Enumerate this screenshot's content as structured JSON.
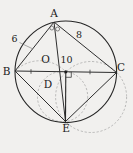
{
  "figure": {
    "background": "#f1f0ee",
    "colors": {
      "stroke": "#2e2e2e",
      "dashed_circles": "#a0a0a0",
      "label_text": "#1b1b1b"
    },
    "labels": {
      "A": "A",
      "B": "B",
      "C": "C",
      "D": "D",
      "E": "E",
      "O": "O"
    },
    "measurements": {
      "AB": "6",
      "AC": "8",
      "BC": "10"
    },
    "marks": [
      "equal-angle-ring-left",
      "equal-angle-ring-right",
      "right-angle-mark-at-O",
      "tick-on-BO",
      "tick-on-OC",
      "center-dot-O",
      "leader-line-6"
    ]
  }
}
